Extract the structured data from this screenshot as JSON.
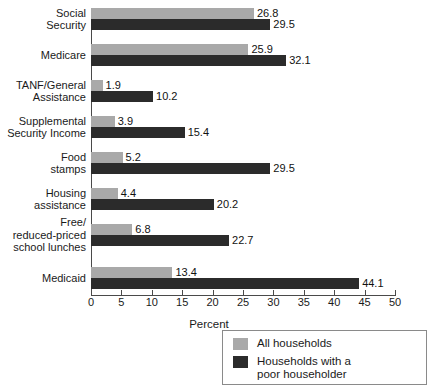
{
  "chart_data": {
    "type": "bar",
    "orientation": "horizontal",
    "title": "",
    "xlabel": "Percent",
    "ylabel": "",
    "xlim": [
      0,
      50
    ],
    "xticks": [
      "0",
      "5",
      "10",
      "15",
      "20",
      "25",
      "30",
      "35",
      "40",
      "45",
      "50"
    ],
    "grid": false,
    "legend_position": "bottom-right",
    "categories": [
      "Social\nSecurity",
      "Medicare",
      "TANF/General\nAssistance",
      "Supplemental\nSecurity Income",
      "Food\nstamps",
      "Housing\nassistance",
      "Free/\nreduced-priced\nschool lunches",
      "Medicaid"
    ],
    "series": [
      {
        "name": "All households",
        "color": "#a9a9a9",
        "values": [
          26.8,
          25.9,
          1.9,
          3.9,
          5.2,
          4.4,
          6.8,
          13.4
        ],
        "labels": [
          "26.8",
          "25.9",
          "1.9",
          "3.9",
          "5.2",
          "4.4",
          "6.8",
          "13.4"
        ]
      },
      {
        "name": "Households with a poor householder",
        "color": "#2b2b2b",
        "values": [
          29.5,
          32.1,
          10.2,
          15.4,
          29.5,
          20.2,
          22.7,
          44.1
        ],
        "labels": [
          "29.5",
          "32.1",
          "10.2",
          "15.4",
          "29.5",
          "20.2",
          "22.7",
          "44.1"
        ]
      }
    ]
  },
  "legend": {
    "entries": [
      {
        "label": "All households",
        "color": "#a9a9a9"
      },
      {
        "label": "Households with a\npoor householder",
        "color": "#2b2b2b"
      }
    ]
  }
}
